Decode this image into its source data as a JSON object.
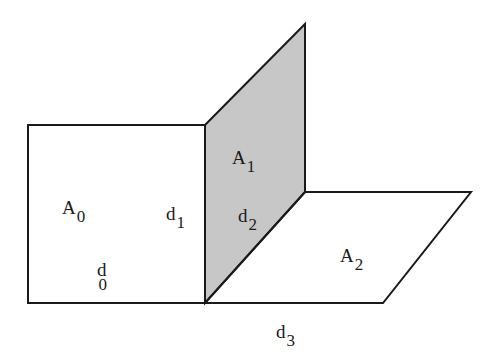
{
  "diagram": {
    "type": "geometric-planes",
    "colors": {
      "stroke": "#1a1a1a",
      "background": "#ffffff",
      "shaded_fill": "#c8c8c8"
    },
    "planes": [
      {
        "id": "A0",
        "base": "A",
        "sub": "0",
        "shaded": false,
        "points": [
          [
            28,
            125
          ],
          [
            205,
            125
          ],
          [
            205,
            303
          ],
          [
            28,
            303
          ]
        ]
      },
      {
        "id": "A1",
        "base": "A",
        "sub": "1",
        "shaded": true,
        "points": [
          [
            205,
            125
          ],
          [
            305,
            24
          ],
          [
            305,
            192
          ],
          [
            205,
            303
          ]
        ]
      },
      {
        "id": "A2",
        "base": "A",
        "sub": "2",
        "shaded": false,
        "points": [
          [
            305,
            192
          ],
          [
            471,
            192
          ],
          [
            383,
            303
          ],
          [
            205,
            303
          ]
        ]
      }
    ],
    "labels": [
      {
        "id": "A0",
        "base": "A",
        "sub": "0",
        "x": 62,
        "y": 198
      },
      {
        "id": "A1",
        "base": "A",
        "sub": "1",
        "x": 232,
        "y": 148
      },
      {
        "id": "A2",
        "base": "A",
        "sub": "2",
        "x": 340,
        "y": 246
      },
      {
        "id": "d0",
        "base": "d",
        "sub": "0",
        "x": 97,
        "y": 260
      },
      {
        "id": "d1",
        "base": "d",
        "sub": "1",
        "x": 166,
        "y": 204
      },
      {
        "id": "d2",
        "base": "d",
        "sub": "2",
        "x": 238,
        "y": 206
      },
      {
        "id": "d3",
        "base": "d",
        "sub": "3",
        "x": 276,
        "y": 322
      }
    ]
  }
}
